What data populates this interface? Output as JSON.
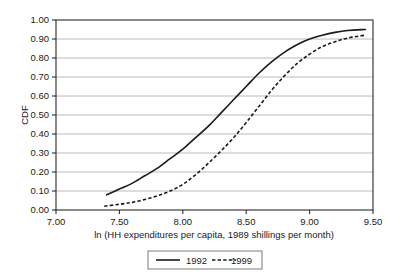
{
  "chart_data": {
    "type": "line",
    "title": "",
    "xlabel": "ln (HH expenditures per capita, 1989 shillings per month)",
    "ylabel": "CDF",
    "xlim": [
      7.0,
      9.5
    ],
    "ylim": [
      0.0,
      1.0
    ],
    "xticks": [
      "7.00",
      "7.50",
      "8.00",
      "8.50",
      "9.00",
      "9.50"
    ],
    "xtick_values": [
      7.0,
      7.5,
      8.0,
      8.5,
      9.0,
      9.5
    ],
    "yticks": [
      "0.00",
      "0.10",
      "0.20",
      "0.30",
      "0.40",
      "0.50",
      "0.60",
      "0.70",
      "0.80",
      "0.90",
      "1.00"
    ],
    "ytick_values": [
      0.0,
      0.1,
      0.2,
      0.3,
      0.4,
      0.5,
      0.6,
      0.7,
      0.8,
      0.9,
      1.0
    ],
    "grid": "horizontal",
    "legend_position": "below-axis-title",
    "series": [
      {
        "name": "1992",
        "style": "solid",
        "color": "#1a1a1a",
        "x": [
          7.4,
          7.5,
          7.6,
          7.7,
          7.8,
          7.9,
          8.0,
          8.1,
          8.2,
          8.3,
          8.4,
          8.5,
          8.6,
          8.7,
          8.8,
          8.9,
          9.0,
          9.1,
          9.2,
          9.3,
          9.44
        ],
        "values": [
          0.08,
          0.11,
          0.14,
          0.18,
          0.22,
          0.27,
          0.32,
          0.38,
          0.44,
          0.51,
          0.58,
          0.65,
          0.72,
          0.78,
          0.83,
          0.87,
          0.9,
          0.92,
          0.935,
          0.945,
          0.95
        ]
      },
      {
        "name": "1999",
        "style": "dashed",
        "color": "#1a1a1a",
        "x": [
          7.38,
          7.5,
          7.6,
          7.7,
          7.8,
          7.9,
          8.0,
          8.1,
          8.2,
          8.3,
          8.4,
          8.5,
          8.6,
          8.7,
          8.8,
          8.9,
          9.0,
          9.1,
          9.2,
          9.3,
          9.44
        ],
        "values": [
          0.02,
          0.03,
          0.04,
          0.055,
          0.075,
          0.1,
          0.135,
          0.185,
          0.245,
          0.31,
          0.38,
          0.46,
          0.545,
          0.63,
          0.705,
          0.77,
          0.82,
          0.86,
          0.885,
          0.905,
          0.92
        ]
      }
    ]
  },
  "legend": {
    "entries": [
      {
        "label": "1992",
        "style": "solid"
      },
      {
        "label": "1999",
        "style": "dashed"
      }
    ]
  }
}
